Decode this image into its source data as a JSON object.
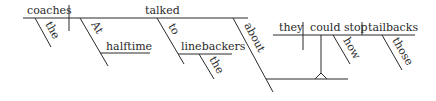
{
  "diagram": {
    "type": "sentence-diagram",
    "style": "Reed-Kellogg",
    "colors": {
      "ink": "#2a2a2a",
      "background": "#ffffff"
    },
    "main_clause": {
      "subject": "coaches",
      "subject_modifier": "the",
      "verb": "talked",
      "adverbial_phrase": {
        "preposition": "At",
        "object": "halftime"
      },
      "prepositional_phrase_1": {
        "preposition": "to",
        "object": "linebackers",
        "object_modifier": "the"
      },
      "prepositional_phrase_2": {
        "preposition": "about"
      }
    },
    "noun_clause": {
      "subject": "they",
      "verb": "could stop",
      "object": "tailbacks",
      "object_modifier": "those",
      "verb_modifier": "how"
    }
  }
}
